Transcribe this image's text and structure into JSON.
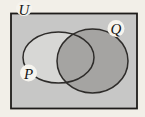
{
  "diagram": {
    "type": "venn-diagram",
    "labels": {
      "universe": "U",
      "set_p": "P",
      "set_q": "Q"
    }
  },
  "colors": {
    "page_bg": "#f2efe8",
    "universe_fill": "#c7c7c6",
    "universe_border": "#1e1c1a",
    "p_fill": "#d7d7d5",
    "q_fill": "#a5a4a2",
    "circle_outline": "#2e2c2a",
    "label_bg": "#f6f4ee"
  }
}
